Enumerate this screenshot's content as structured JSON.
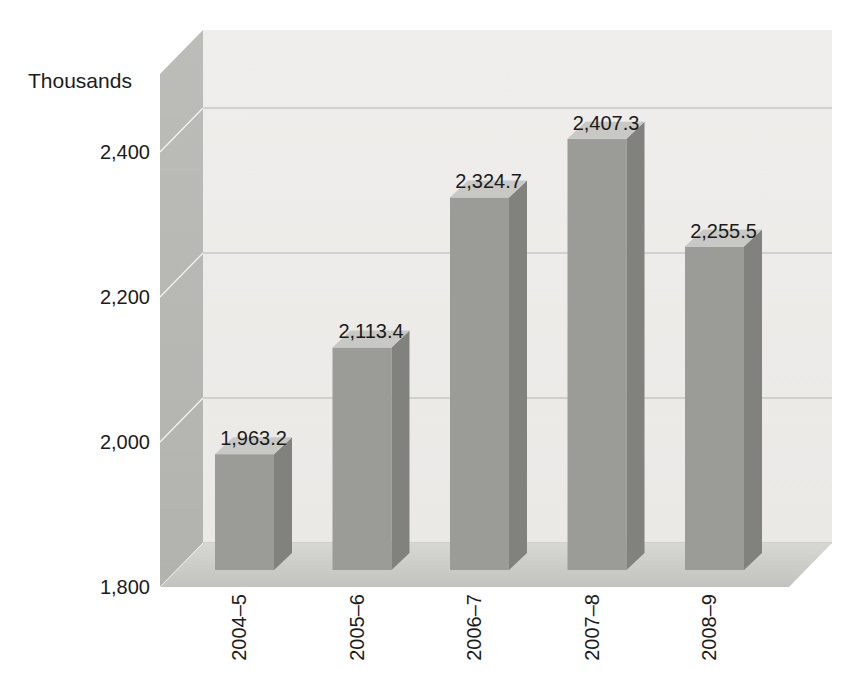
{
  "chart_data": {
    "type": "bar",
    "style": "3d-column",
    "title": "",
    "ylabel": "Thousands",
    "xlabel": "",
    "categories": [
      "2004–5",
      "2005–6",
      "2006–7",
      "2007–8",
      "2008–9"
    ],
    "values": [
      1963.2,
      2113.4,
      2324.7,
      2407.3,
      2255.5
    ],
    "value_labels": [
      "1,963.2",
      "2,113.4",
      "2,324.7",
      "2,407.3",
      "2,255.5"
    ],
    "yticks": [
      1800,
      2000,
      2200,
      2400
    ],
    "ytick_labels": [
      "1,800",
      "2,000",
      "2,200",
      "2,400"
    ],
    "ylim": [
      1800,
      2500
    ],
    "grid": true,
    "legend": false,
    "series_name": "",
    "colors": {
      "bar_front": "#9b9b98",
      "bar_side": "#81817e",
      "bar_top": "#c8c8c5",
      "wall_back_top": "#efeeec",
      "wall_back_bottom": "#eae9e6",
      "wall_left_top": "#bcbcb9",
      "wall_left_bottom": "#b2b2af",
      "floor_back": "#d7d7d4",
      "floor_front": "#c2c2bf",
      "gridline": "#b5b5b2",
      "wall_gridline": "#ffffff",
      "text": "#1b1b1b",
      "background": "#ffffff"
    }
  }
}
